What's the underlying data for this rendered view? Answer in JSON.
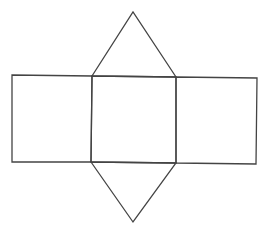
{
  "diagram": {
    "stroke_color": "#444444",
    "background": "#ffffff",
    "shapes": {
      "left_rect": {
        "points": "12,75 92,76 91,162 12,162"
      },
      "center_rect": {
        "points": "92,76 176,77 176,163 91,162"
      },
      "right_rect": {
        "points": "176,77 257,78 256,164 176,163"
      },
      "top_triangle": {
        "points": "92,76 133,12 176,77"
      },
      "bottom_triangle": {
        "points": "91,162 133,222 176,163"
      }
    }
  }
}
